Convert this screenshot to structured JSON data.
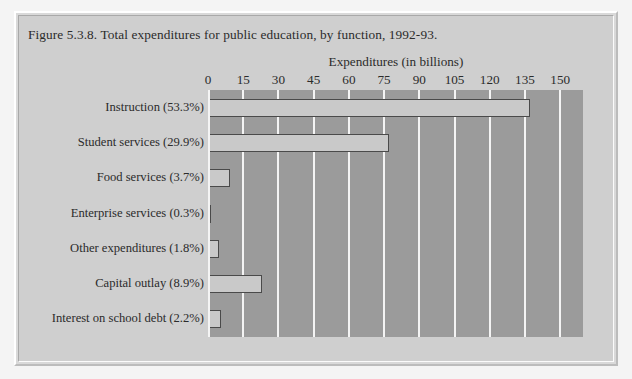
{
  "figure": {
    "title": "Figure 5.3.8. Total expenditures for public education, by function, 1992-93.",
    "bar_fill": "#c9c9c9",
    "bar_edge": "#4a4a4a",
    "plot_bg": "#9b9b9b",
    "panel_bg": "#cfcfcf",
    "gridline_color": "#f4f4f4"
  },
  "chart_data": {
    "type": "bar",
    "orientation": "horizontal",
    "title": "Figure 5.3.8. Total expenditures for public education, by function, 1992-93.",
    "xlabel": "Expenditures (in billions)",
    "ylabel": "",
    "xlim": [
      0,
      160
    ],
    "xticks": [
      0,
      15,
      30,
      45,
      60,
      75,
      90,
      105,
      120,
      135,
      150
    ],
    "xtick_labels": [
      "0",
      "15",
      "30",
      "45",
      "60",
      "75",
      "90",
      "105",
      "120",
      "135",
      "150"
    ],
    "grid": true,
    "legend": false,
    "categories": [
      "Instruction (53.3%)",
      "Student services (29.9%)",
      "Food services (3.7%)",
      "Enterprise services (0.3%)",
      "Other expenditures (1.8%)",
      "Capital outlay (8.9%)",
      "Interest on school debt (2.2%)"
    ],
    "values": [
      137.0,
      77.0,
      9.5,
      0.8,
      4.6,
      23.0,
      5.7
    ],
    "percentages": [
      53.3,
      29.9,
      3.7,
      0.3,
      1.8,
      8.9,
      2.2
    ],
    "units": "billions of dollars"
  }
}
